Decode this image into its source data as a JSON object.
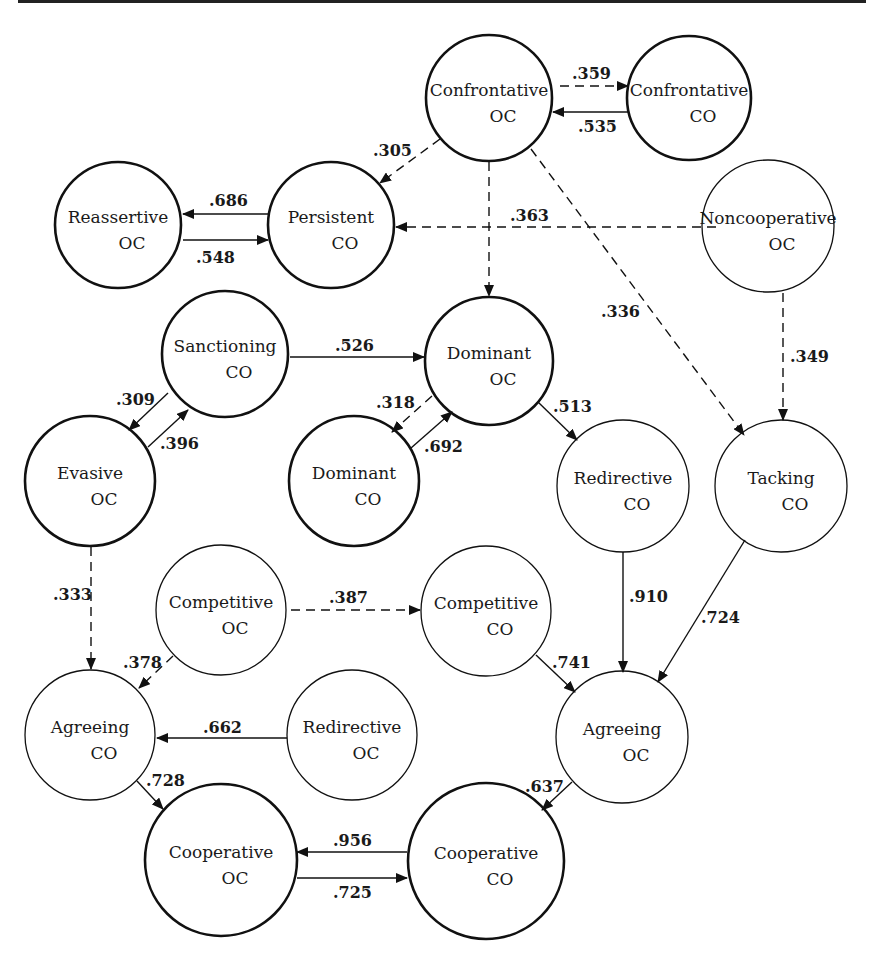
{
  "diagram": {
    "type": "directed-path-diagram",
    "nodes": [
      {
        "id": "confrontative_oc",
        "line1": "Confrontative",
        "line2": "OC",
        "cx": 489,
        "cy": 98,
        "r": 63,
        "thick": true
      },
      {
        "id": "confrontative_co",
        "line1": "Confrontative",
        "line2": "CO",
        "cx": 689,
        "cy": 98,
        "r": 62,
        "thick": true
      },
      {
        "id": "reassertive_oc",
        "line1": "Reassertive",
        "line2": "OC",
        "cx": 118,
        "cy": 225,
        "r": 63,
        "thick": true
      },
      {
        "id": "persistent_co",
        "line1": "Persistent",
        "line2": "CO",
        "cx": 331,
        "cy": 225,
        "r": 63,
        "thick": true
      },
      {
        "id": "noncooperative_oc",
        "line1": "Noncooperative",
        "line2": "OC",
        "cx": 768,
        "cy": 226,
        "r": 66,
        "thick": false
      },
      {
        "id": "sanctioning_co",
        "line1": "Sanctioning",
        "line2": "CO",
        "cx": 225,
        "cy": 354,
        "r": 63,
        "thick": true
      },
      {
        "id": "dominant_oc",
        "line1": "Dominant",
        "line2": "OC",
        "cx": 489,
        "cy": 361,
        "r": 64,
        "thick": true
      },
      {
        "id": "evasive_oc",
        "line1": "Evasive",
        "line2": "OC",
        "cx": 90,
        "cy": 481,
        "r": 65,
        "thick": true
      },
      {
        "id": "dominant_co",
        "line1": "Dominant",
        "line2": "CO",
        "cx": 354,
        "cy": 481,
        "r": 65,
        "thick": true
      },
      {
        "id": "redirective_co",
        "line1": "Redirective",
        "line2": "CO",
        "cx": 623,
        "cy": 486,
        "r": 66,
        "thick": false
      },
      {
        "id": "tacking_co",
        "line1": "Tacking",
        "line2": "CO",
        "cx": 781,
        "cy": 486,
        "r": 66,
        "thick": false
      },
      {
        "id": "competitive_oc",
        "line1": "Competitive",
        "line2": "OC",
        "cx": 221,
        "cy": 610,
        "r": 65,
        "thick": false
      },
      {
        "id": "competitive_co",
        "line1": "Competitive",
        "line2": "CO",
        "cx": 486,
        "cy": 611,
        "r": 65,
        "thick": false
      },
      {
        "id": "agreeing_co",
        "line1": "Agreeing",
        "line2": "CO",
        "cx": 90,
        "cy": 735,
        "r": 65,
        "thick": false
      },
      {
        "id": "redirective_oc",
        "line1": "Redirective",
        "line2": "OC",
        "cx": 352,
        "cy": 735,
        "r": 65,
        "thick": false
      },
      {
        "id": "agreeing_oc",
        "line1": "Agreeing",
        "line2": "OC",
        "cx": 622,
        "cy": 737,
        "r": 66,
        "thick": false
      },
      {
        "id": "cooperative_oc",
        "line1": "Cooperative",
        "line2": "OC",
        "cx": 221,
        "cy": 860,
        "r": 76,
        "thick": true
      },
      {
        "id": "cooperative_co",
        "line1": "Cooperative",
        "line2": "CO",
        "cx": 486,
        "cy": 861,
        "r": 78,
        "thick": true
      }
    ],
    "edges": [
      {
        "from": "confrontative_oc",
        "to": "confrontative_co",
        "weight": ".359",
        "dashed": true,
        "x1": 560,
        "y1": 86,
        "x2": 628,
        "y2": 86,
        "lx": 572,
        "ly": 79
      },
      {
        "from": "confrontative_co",
        "to": "confrontative_oc",
        "weight": ".535",
        "dashed": false,
        "x1": 628,
        "y1": 112,
        "x2": 553,
        "y2": 112,
        "lx": 578,
        "ly": 132
      },
      {
        "from": "confrontative_oc",
        "to": "persistent_co",
        "weight": ".305",
        "dashed": true,
        "x1": 440,
        "y1": 139,
        "x2": 380,
        "y2": 183,
        "lx": 373,
        "ly": 156
      },
      {
        "from": "persistent_co",
        "to": "reassertive_oc",
        "weight": ".686",
        "dashed": false,
        "x1": 268,
        "y1": 214,
        "x2": 183,
        "y2": 214,
        "lx": 209,
        "ly": 206
      },
      {
        "from": "reassertive_oc",
        "to": "persistent_co",
        "weight": ".548",
        "dashed": false,
        "x1": 183,
        "y1": 240,
        "x2": 268,
        "y2": 240,
        "lx": 196,
        "ly": 263
      },
      {
        "from": "noncooperative_oc",
        "to": "persistent_co",
        "weight": ".363",
        "dashed": true,
        "x1": 716,
        "y1": 227,
        "x2": 396,
        "y2": 227,
        "lx": 510,
        "ly": 221
      },
      {
        "from": "confrontative_oc",
        "to": "dominant_oc",
        "weight": "",
        "dashed": true,
        "x1": 489,
        "y1": 162,
        "x2": 489,
        "y2": 296,
        "lx": 0,
        "ly": 0
      },
      {
        "from": "confrontative_oc",
        "to": "tacking_co",
        "weight": ".336",
        "dashed": true,
        "x1": 531,
        "y1": 149,
        "x2": 744,
        "y2": 435,
        "lx": 601,
        "ly": 317
      },
      {
        "from": "noncooperative_oc",
        "to": "tacking_co",
        "weight": ".349",
        "dashed": true,
        "x1": 783,
        "y1": 293,
        "x2": 783,
        "y2": 420,
        "lx": 790,
        "ly": 362
      },
      {
        "from": "sanctioning_co",
        "to": "dominant_oc",
        "weight": ".526",
        "dashed": false,
        "x1": 290,
        "y1": 357,
        "x2": 424,
        "y2": 357,
        "lx": 335,
        "ly": 351
      },
      {
        "from": "sanctioning_co",
        "to": "evasive_oc",
        "weight": ".309",
        "dashed": false,
        "x1": 168,
        "y1": 393,
        "x2": 129,
        "y2": 430,
        "lx": 116,
        "ly": 405
      },
      {
        "from": "evasive_oc",
        "to": "sanctioning_co",
        "weight": ".396",
        "dashed": false,
        "x1": 148,
        "y1": 447,
        "x2": 188,
        "y2": 410,
        "lx": 160,
        "ly": 449
      },
      {
        "from": "dominant_oc",
        "to": "dominant_co",
        "weight": ".318",
        "dashed": true,
        "x1": 432,
        "y1": 396,
        "x2": 392,
        "y2": 432,
        "lx": 376,
        "ly": 408
      },
      {
        "from": "dominant_co",
        "to": "dominant_oc",
        "weight": ".692",
        "dashed": false,
        "x1": 411,
        "y1": 448,
        "x2": 452,
        "y2": 412,
        "lx": 424,
        "ly": 452
      },
      {
        "from": "dominant_oc",
        "to": "redirective_co",
        "weight": ".513",
        "dashed": false,
        "x1": 538,
        "y1": 402,
        "x2": 577,
        "y2": 440,
        "lx": 553,
        "ly": 412
      },
      {
        "from": "evasive_oc",
        "to": "agreeing_co",
        "weight": ".333",
        "dashed": true,
        "x1": 91,
        "y1": 547,
        "x2": 91,
        "y2": 669,
        "lx": 53,
        "ly": 600
      },
      {
        "from": "competitive_oc",
        "to": "competitive_co",
        "weight": ".387",
        "dashed": true,
        "x1": 291,
        "y1": 610,
        "x2": 420,
        "y2": 610,
        "lx": 329,
        "ly": 603
      },
      {
        "from": "competitive_oc",
        "to": "agreeing_co",
        "weight": ".378",
        "dashed": true,
        "x1": 173,
        "y1": 656,
        "x2": 139,
        "y2": 688,
        "lx": 123,
        "ly": 668
      },
      {
        "from": "redirective_co",
        "to": "agreeing_oc",
        "weight": ".910",
        "dashed": false,
        "x1": 623,
        "y1": 552,
        "x2": 623,
        "y2": 672,
        "lx": 629,
        "ly": 602
      },
      {
        "from": "tacking_co",
        "to": "agreeing_oc",
        "weight": ".724",
        "dashed": false,
        "x1": 745,
        "y1": 540,
        "x2": 658,
        "y2": 682,
        "lx": 701,
        "ly": 623
      },
      {
        "from": "competitive_co",
        "to": "agreeing_oc",
        "weight": ".741",
        "dashed": false,
        "x1": 536,
        "y1": 655,
        "x2": 575,
        "y2": 692,
        "lx": 552,
        "ly": 668
      },
      {
        "from": "redirective_oc",
        "to": "agreeing_co",
        "weight": ".662",
        "dashed": false,
        "x1": 287,
        "y1": 738,
        "x2": 157,
        "y2": 738,
        "lx": 203,
        "ly": 733
      },
      {
        "from": "agreeing_co",
        "to": "cooperative_oc",
        "weight": ".728",
        "dashed": false,
        "x1": 137,
        "y1": 781,
        "x2": 163,
        "y2": 809,
        "lx": 146,
        "ly": 786
      },
      {
        "from": "agreeing_oc",
        "to": "cooperative_co",
        "weight": ".637",
        "dashed": false,
        "x1": 572,
        "y1": 782,
        "x2": 542,
        "y2": 810,
        "lx": 525,
        "ly": 792
      },
      {
        "from": "cooperative_co",
        "to": "cooperative_oc",
        "weight": ".956",
        "dashed": false,
        "x1": 407,
        "y1": 852,
        "x2": 297,
        "y2": 852,
        "lx": 333,
        "ly": 846
      },
      {
        "from": "cooperative_oc",
        "to": "cooperative_co",
        "weight": ".725",
        "dashed": false,
        "x1": 297,
        "y1": 878,
        "x2": 407,
        "y2": 878,
        "lx": 333,
        "ly": 898
      }
    ]
  }
}
